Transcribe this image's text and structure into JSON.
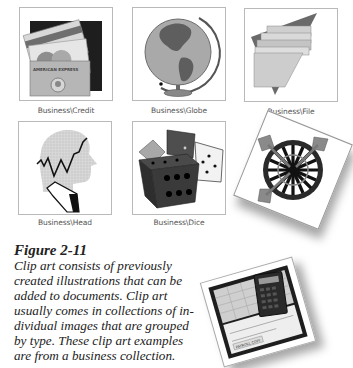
{
  "clipart": [
    {
      "id": "credit",
      "caption": "Business\\Credit",
      "card_text_1": "ISA",
      "card_text_2": "AMERICAN EXPRESS"
    },
    {
      "id": "globe",
      "caption": "Business\\Globe"
    },
    {
      "id": "file",
      "caption": "Business\\File"
    },
    {
      "id": "head",
      "caption": "Business\\Head"
    },
    {
      "id": "dice",
      "caption": "Business\\Dice"
    },
    {
      "id": "dartboard",
      "caption": ""
    },
    {
      "id": "checkbook",
      "caption": "",
      "check_text": "PAYROLL COPY"
    }
  ],
  "figure": {
    "title": "Figure 2-11",
    "lines": [
      "Clip art consists of previously",
      "created illustrations that can be",
      "added to documents. Clip art",
      "usually comes in collections of in-",
      "dividual images that are grouped",
      "by type. These clip art examples",
      "are from a business collection."
    ]
  },
  "colors": {
    "frame_border": "#b9b9b9",
    "caption_text": "#555555",
    "body_text": "#222222",
    "dark": "#2b2b2b",
    "mid_gray": "#8a8a8a",
    "light_gray": "#c8c8c8"
  }
}
